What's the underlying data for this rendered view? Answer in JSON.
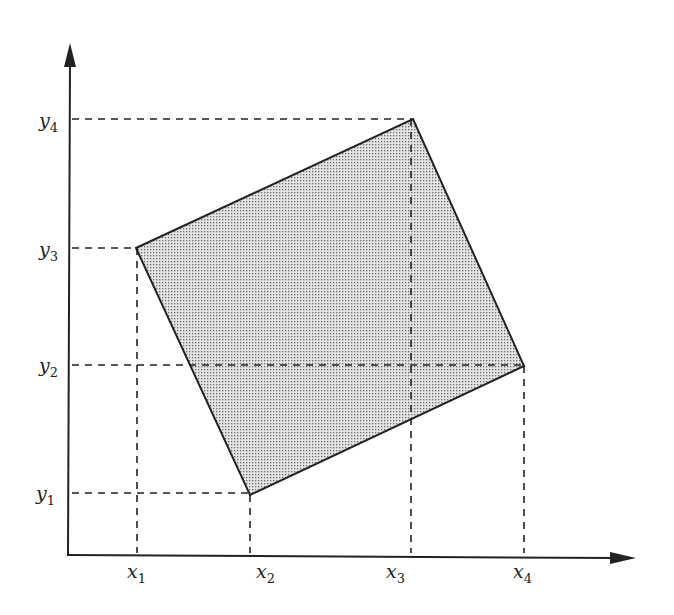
{
  "diagram": {
    "colors": {
      "axis": "#222222",
      "fill": "#d8d8d8",
      "dots": "#6a6a6a",
      "dash": "#222222"
    },
    "axes": {
      "origin": [
        67,
        555
      ],
      "y_axis_top": [
        69,
        43
      ],
      "x_axis_right": [
        636,
        558
      ]
    },
    "x_labels": [
      {
        "base": "x",
        "sub": "1",
        "x": 136
      },
      {
        "base": "x",
        "sub": "2",
        "x": 250
      },
      {
        "base": "x",
        "sub": "3",
        "x": 411
      },
      {
        "base": "x",
        "sub": "4",
        "x": 524
      }
    ],
    "y_labels": [
      {
        "base": "y",
        "sub": "1",
        "y": 493
      },
      {
        "base": "y",
        "sub": "2",
        "y": 365
      },
      {
        "base": "y",
        "sub": "3",
        "y": 248
      },
      {
        "base": "y",
        "sub": "4",
        "y": 119
      }
    ],
    "polygon": {
      "vertices": [
        {
          "name": "(x1, y3)",
          "x": 136,
          "y": 248
        },
        {
          "name": "(x3, y4)",
          "x": 413,
          "y": 119
        },
        {
          "name": "(x4, y2)",
          "x": 524,
          "y": 366
        },
        {
          "name": "(x2, y1)",
          "x": 250,
          "y": 495
        }
      ]
    }
  }
}
